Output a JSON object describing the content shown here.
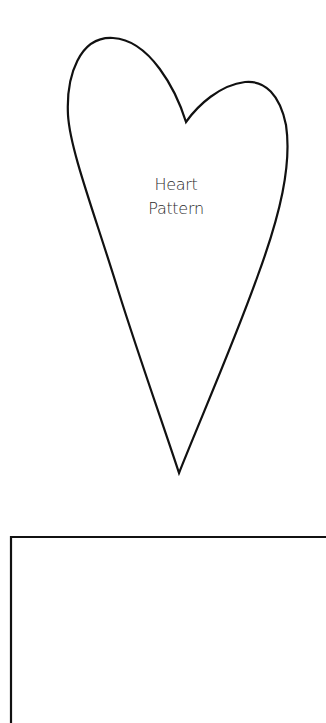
{
  "pattern": {
    "label_line1": "Heart",
    "label_line2": "Pattern",
    "stroke_color": "#111111",
    "background_color": "#ffffff"
  }
}
